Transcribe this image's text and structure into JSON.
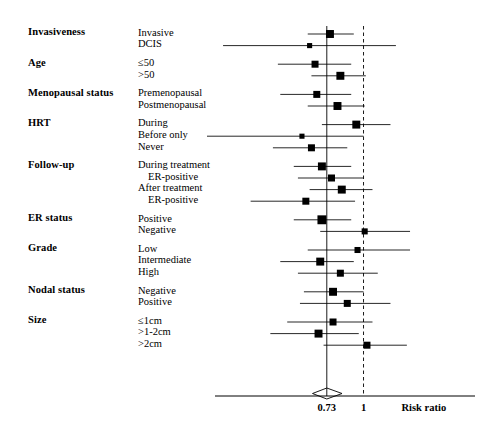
{
  "figure": {
    "axis": {
      "title": "Risk ratio",
      "tick_labels": [
        "0.73",
        "1"
      ],
      "tick_values": [
        0.73,
        1.0
      ],
      "reference_line_value": 1.0,
      "pooled_line_value": 0.73,
      "scale": "log",
      "xlim": [
        0.28,
        2.6
      ]
    },
    "colors": {
      "ink": "#000000",
      "rule": "#333333"
    },
    "column_headers": {
      "group": "",
      "level": ""
    }
  },
  "chart_data": {
    "type": "forest",
    "title": "",
    "xlabel": "Risk ratio",
    "ylabel": "",
    "xlim": [
      0.28,
      2.6
    ],
    "xscale": "log",
    "xticks": [
      0.73,
      1.0
    ],
    "xticklabels": [
      "0.73",
      "1"
    ],
    "reference_line": 1.0,
    "pooled_line": 0.73,
    "pooled_diamond": {
      "estimate": 0.73,
      "ci_low": 0.68,
      "ci_high": 0.79
    },
    "grid": false,
    "legend": "none",
    "groups": [
      {
        "name": "Invasiveness",
        "rows": [
          {
            "label": "Invasive",
            "indent": 0,
            "estimate": 0.75,
            "ci_low": 0.62,
            "ci_high": 0.92,
            "weight": 5
          },
          {
            "label": "DCIS",
            "indent": 0,
            "estimate": 0.63,
            "ci_low": 0.3,
            "ci_high": 1.32,
            "weight": 2
          }
        ]
      },
      {
        "name": "Age",
        "rows": [
          {
            "label": "≤50",
            "indent": 0,
            "estimate": 0.66,
            "ci_low": 0.48,
            "ci_high": 0.9,
            "weight": 4
          },
          {
            "label": ">50",
            "indent": 0,
            "estimate": 0.82,
            "ci_low": 0.64,
            "ci_high": 1.02,
            "weight": 5
          }
        ]
      },
      {
        "name": "Menopausal status",
        "rows": [
          {
            "label": "Premenopausal",
            "indent": 0,
            "estimate": 0.67,
            "ci_low": 0.49,
            "ci_high": 0.9,
            "weight": 4
          },
          {
            "label": "Postmenopausal",
            "indent": 0,
            "estimate": 0.8,
            "ci_low": 0.62,
            "ci_high": 1.01,
            "weight": 5
          }
        ]
      },
      {
        "name": "HRT",
        "rows": [
          {
            "label": "During",
            "indent": 0,
            "estimate": 0.94,
            "ci_low": 0.7,
            "ci_high": 1.26,
            "weight": 5
          },
          {
            "label": "Before only",
            "indent": 0,
            "estimate": 0.59,
            "ci_low": 0.26,
            "ci_high": 1.0,
            "weight": 2
          },
          {
            "label": "Never",
            "indent": 0,
            "estimate": 0.64,
            "ci_low": 0.46,
            "ci_high": 0.87,
            "weight": 4
          }
        ]
      },
      {
        "name": "Follow-up",
        "rows": [
          {
            "label": "During treatment",
            "indent": 0,
            "estimate": 0.7,
            "ci_low": 0.55,
            "ci_high": 0.9,
            "weight": 5
          },
          {
            "label": "ER-positive",
            "indent": 1,
            "estimate": 0.76,
            "ci_low": 0.57,
            "ci_high": 1.0,
            "weight": 4
          },
          {
            "label": "After treatment",
            "indent": 0,
            "estimate": 0.83,
            "ci_low": 0.63,
            "ci_high": 1.08,
            "weight": 5
          },
          {
            "label": "ER-positive",
            "indent": 1,
            "estimate": 0.61,
            "ci_low": 0.38,
            "ci_high": 0.93,
            "weight": 4
          }
        ]
      },
      {
        "name": "ER status",
        "rows": [
          {
            "label": "Positive",
            "indent": 0,
            "estimate": 0.7,
            "ci_low": 0.55,
            "ci_high": 0.9,
            "weight": 6
          },
          {
            "label": "Negative",
            "indent": 0,
            "estimate": 1.01,
            "ci_low": 0.69,
            "ci_high": 1.49,
            "weight": 3
          }
        ]
      },
      {
        "name": "Grade",
        "rows": [
          {
            "label": "Low",
            "indent": 0,
            "estimate": 0.95,
            "ci_low": 0.62,
            "ci_high": 1.49,
            "weight": 3
          },
          {
            "label": "Intermediate",
            "indent": 0,
            "estimate": 0.69,
            "ci_low": 0.49,
            "ci_high": 0.92,
            "weight": 5
          },
          {
            "label": "High",
            "indent": 0,
            "estimate": 0.82,
            "ci_low": 0.57,
            "ci_high": 1.13,
            "weight": 4
          }
        ]
      },
      {
        "name": "Nodal status",
        "rows": [
          {
            "label": "Negative",
            "indent": 0,
            "estimate": 0.77,
            "ci_low": 0.6,
            "ci_high": 1.0,
            "weight": 5
          },
          {
            "label": "Positive",
            "indent": 0,
            "estimate": 0.87,
            "ci_low": 0.58,
            "ci_high": 1.26,
            "weight": 4
          }
        ]
      },
      {
        "name": "Size",
        "rows": [
          {
            "label": "≤1cm",
            "indent": 0,
            "estimate": 0.77,
            "ci_low": 0.52,
            "ci_high": 1.08,
            "weight": 4
          },
          {
            "label": ">1-2cm",
            "indent": 0,
            "estimate": 0.68,
            "ci_low": 0.45,
            "ci_high": 0.96,
            "weight": 5
          },
          {
            "label": ">2cm",
            "indent": 0,
            "estimate": 1.03,
            "ci_low": 0.71,
            "ci_high": 1.45,
            "weight": 4
          }
        ]
      }
    ]
  }
}
